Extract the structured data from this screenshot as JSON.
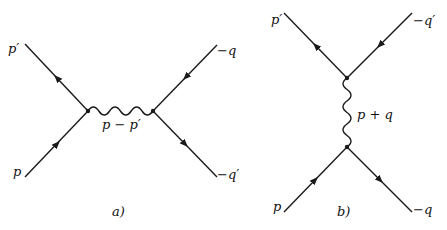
{
  "colors": {
    "line": "#1a1a1a",
    "background": "#ffffff"
  },
  "diagram_a": {
    "caption": "a)",
    "labels": {
      "top_left": "p′",
      "bottom_left": "p",
      "top_right": "−q",
      "bottom_right": "−q′",
      "propagator": "p − p′"
    },
    "propagator_type": "photon (wavy, horizontal)",
    "vertices": [
      [
        88,
        111
      ],
      [
        153,
        111
      ]
    ],
    "fermion_lines": [
      {
        "from": [
          25,
          44
        ],
        "to": [
          88,
          111
        ],
        "arrow": "toward p′ (up-left)"
      },
      {
        "from": [
          25,
          177
        ],
        "to": [
          88,
          111
        ],
        "arrow": "toward vertex"
      },
      {
        "from": [
          217,
          45
        ],
        "to": [
          153,
          111
        ],
        "arrow": "toward vertex"
      },
      {
        "from": [
          153,
          111
        ],
        "to": [
          217,
          177
        ],
        "arrow": "away from vertex"
      }
    ]
  },
  "diagram_b": {
    "caption": "b)",
    "labels": {
      "top_left": "p′",
      "top_right": "−q′",
      "bottom_left": "p",
      "bottom_right": "−q",
      "propagator": "p + q"
    },
    "propagator_type": "photon (wavy, vertical)",
    "vertices": [
      [
        347,
        78
      ],
      [
        347,
        147
      ]
    ],
    "fermion_lines": [
      {
        "from": [
          284,
          13
        ],
        "to": [
          347,
          78
        ],
        "arrow": "toward p′ (up-left)"
      },
      {
        "from": [
          412,
          13
        ],
        "to": [
          347,
          78
        ],
        "arrow": "toward vertex"
      },
      {
        "from": [
          284,
          212
        ],
        "to": [
          347,
          147
        ],
        "arrow": "toward vertex"
      },
      {
        "from": [
          347,
          147
        ],
        "to": [
          412,
          212
        ],
        "arrow": "away from vertex"
      }
    ]
  }
}
